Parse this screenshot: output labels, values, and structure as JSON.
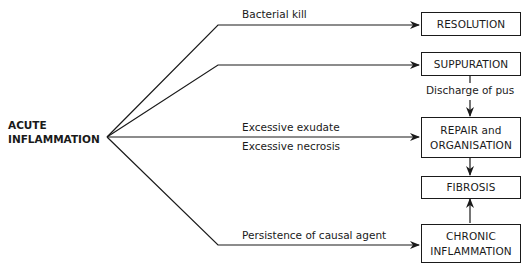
{
  "source": {
    "line1": "ACUTE",
    "line2": "INFLAMMATION"
  },
  "outcomes": {
    "resolution": "RESOLUTION",
    "suppuration": "SUPPURATION",
    "repair_line1": "REPAIR and",
    "repair_line2": "ORGANISATION",
    "fibrosis": "FIBROSIS",
    "chronic_line1": "CHRONIC",
    "chronic_line2": "INFLAMMATION"
  },
  "edges": {
    "bacterial_kill": "Bacterial kill",
    "excessive_exudate": "Excessive exudate",
    "excessive_necrosis": "Excessive necrosis",
    "persistence": "Persistence of causal agent",
    "discharge": "Discharge of pus"
  },
  "colors": {
    "line": "#1a1a1a",
    "background": "#ffffff"
  }
}
